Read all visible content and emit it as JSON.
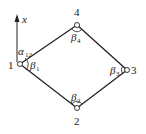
{
  "diagram": {
    "type": "traverse-polygon",
    "axis": {
      "label": "x",
      "direction": "north"
    },
    "stations": [
      {
        "id": "1",
        "label": "1"
      },
      {
        "id": "2",
        "label": "2"
      },
      {
        "id": "3",
        "label": "3"
      },
      {
        "id": "4",
        "label": "4"
      }
    ],
    "edges": [
      [
        "1",
        "4"
      ],
      [
        "4",
        "3"
      ],
      [
        "3",
        "2"
      ],
      [
        "2",
        "1"
      ]
    ],
    "angles": {
      "alpha12": {
        "symbol": "α",
        "sub": "12"
      },
      "beta1": {
        "symbol": "β",
        "sub": "1"
      },
      "beta2": {
        "symbol": "β",
        "sub": "2"
      },
      "beta3": {
        "symbol": "β",
        "sub": "3"
      },
      "beta4": {
        "symbol": "β",
        "sub": "4"
      }
    },
    "colors": {
      "line": "#222222",
      "background": "#ffffff"
    }
  }
}
